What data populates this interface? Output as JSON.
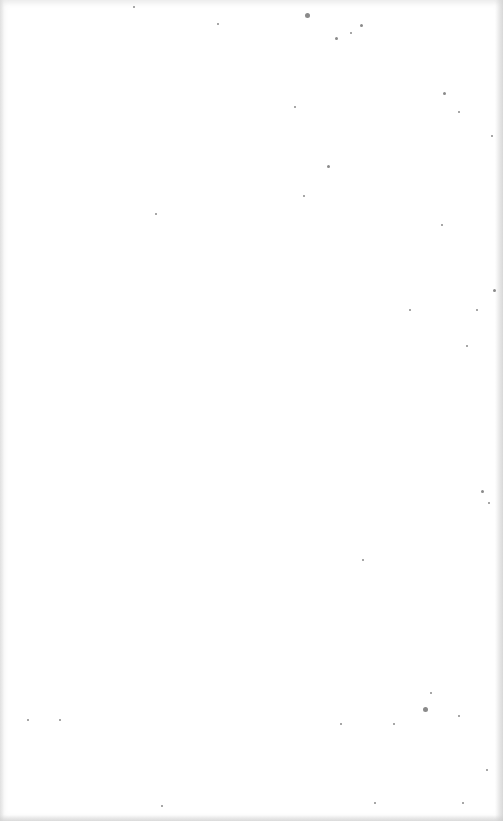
{
  "page": {
    "content": "",
    "background_color": "#ffffff",
    "speck_color": "#8a8a8a",
    "specks": [
      {
        "x": 307,
        "y": 15,
        "r": 2.5
      },
      {
        "x": 336,
        "y": 38,
        "r": 1.5
      },
      {
        "x": 361,
        "y": 25,
        "r": 1.5
      },
      {
        "x": 351,
        "y": 33,
        "r": 1
      },
      {
        "x": 218,
        "y": 24,
        "r": 1
      },
      {
        "x": 134,
        "y": 7,
        "r": 1
      },
      {
        "x": 328,
        "y": 166,
        "r": 1.5
      },
      {
        "x": 295,
        "y": 107,
        "r": 1
      },
      {
        "x": 444,
        "y": 93,
        "r": 1.5
      },
      {
        "x": 459,
        "y": 112,
        "r": 1
      },
      {
        "x": 492,
        "y": 136,
        "r": 1
      },
      {
        "x": 304,
        "y": 196,
        "r": 1
      },
      {
        "x": 156,
        "y": 214,
        "r": 1
      },
      {
        "x": 442,
        "y": 225,
        "r": 1
      },
      {
        "x": 494,
        "y": 290,
        "r": 1.5
      },
      {
        "x": 477,
        "y": 310,
        "r": 1
      },
      {
        "x": 410,
        "y": 310,
        "r": 1
      },
      {
        "x": 467,
        "y": 346,
        "r": 1
      },
      {
        "x": 482,
        "y": 491,
        "r": 1.5
      },
      {
        "x": 489,
        "y": 503,
        "r": 1
      },
      {
        "x": 363,
        "y": 560,
        "r": 1
      },
      {
        "x": 425,
        "y": 709,
        "r": 2.5
      },
      {
        "x": 431,
        "y": 693,
        "r": 1
      },
      {
        "x": 341,
        "y": 724,
        "r": 1
      },
      {
        "x": 394,
        "y": 724,
        "r": 1
      },
      {
        "x": 459,
        "y": 716,
        "r": 1
      },
      {
        "x": 487,
        "y": 770,
        "r": 1
      },
      {
        "x": 28,
        "y": 720,
        "r": 1
      },
      {
        "x": 60,
        "y": 720,
        "r": 1
      },
      {
        "x": 162,
        "y": 806,
        "r": 1
      },
      {
        "x": 375,
        "y": 803,
        "r": 1
      },
      {
        "x": 463,
        "y": 803,
        "r": 1
      }
    ]
  }
}
